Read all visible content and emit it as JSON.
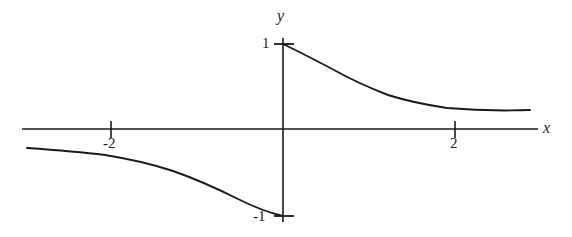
{
  "figure": {
    "background_color": "#ffffff",
    "stroke_color": "#1a1a1a",
    "title": ""
  },
  "axes": {
    "x_label": "x",
    "y_label": "y",
    "x_ticks": [
      {
        "value": -2,
        "label": "-2",
        "px": 111
      },
      {
        "value": 2,
        "label": "2",
        "px": 455
      }
    ],
    "y_ticks": [
      {
        "value": 1,
        "label": "1",
        "px": 44
      },
      {
        "value": -1,
        "label": "-1",
        "px": 216
      }
    ],
    "origin_px": {
      "x": 283,
      "y": 129
    },
    "unit_px": 86,
    "x_axis_extent_px": {
      "start": 22,
      "end": 538
    },
    "y_axis_extent_px": {
      "top": 38,
      "bottom": 222
    }
  },
  "chart_data": {
    "type": "line",
    "title": "",
    "xlabel": "x",
    "ylabel": "y",
    "grid": false,
    "legend": null,
    "xlim": [
      -3.0,
      2.97
    ],
    "ylim": [
      -1.15,
      1.15
    ],
    "xticks": [
      -2,
      2
    ],
    "xticklabels": [
      "-2",
      "2"
    ],
    "yticks": [
      -1,
      1
    ],
    "yticklabels": [
      "-1",
      "1"
    ],
    "series": [
      {
        "name": "right-branch",
        "x": [
          0.0,
          0.15,
          0.3,
          0.5,
          0.75,
          1.0,
          1.25,
          1.5,
          1.75,
          2.0,
          2.25,
          2.5,
          2.75,
          2.87
        ],
        "y": [
          1.0,
          0.87,
          0.77,
          0.67,
          0.57,
          0.5,
          0.44,
          0.4,
          0.36,
          0.33,
          0.31,
          0.29,
          0.27,
          0.26
        ]
      },
      {
        "name": "left-branch",
        "x": [
          -2.98,
          -2.75,
          -2.5,
          -2.25,
          -2.0,
          -1.75,
          -1.5,
          -1.25,
          -1.0,
          -0.75,
          -0.5,
          -0.3,
          -0.15,
          0.0
        ],
        "y": [
          -0.22,
          -0.24,
          -0.26,
          -0.28,
          -0.31,
          -0.35,
          -0.4,
          -0.46,
          -0.53,
          -0.62,
          -0.7,
          -0.82,
          -0.91,
          -1.0
        ]
      }
    ]
  },
  "geometry": {
    "right_branch_path": "M 283,44 C 300,52 317,61 334,70 C 352,80 370,88 388,95 C 407,101 427,105 447,108 C 470,110 500,111 530,110",
    "left_branch_path": "M 27,148 C 55,150 80,152 105,155 C 130,159 152,164 173,171 C 196,179 218,189 238,199 C 254,207 270,213 283,216",
    "x_axis_line": {
      "x1": 22,
      "y1": 129,
      "x2": 538,
      "y2": 129
    },
    "y_axis_line": {
      "x1": 283,
      "y1": 38,
      "x2": 283,
      "y2": 222
    },
    "tick_marks": [
      {
        "name": "tick-neg2",
        "x1": 111,
        "y1": 121,
        "x2": 111,
        "y2": 138
      },
      {
        "name": "tick-pos2",
        "x1": 455,
        "y1": 121,
        "x2": 455,
        "y2": 138
      },
      {
        "name": "tick-y1",
        "x1": 274,
        "y1": 44,
        "x2": 294,
        "y2": 44
      },
      {
        "name": "tick-yneg1",
        "x1": 274,
        "y1": 216,
        "x2": 294,
        "y2": 216
      }
    ]
  }
}
